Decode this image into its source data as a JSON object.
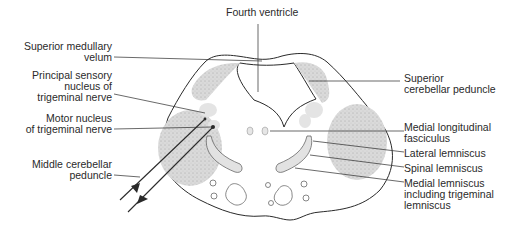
{
  "diagram": {
    "colors": {
      "ink": "#2a2a2a",
      "stipple_fill": "#d9d9d9",
      "light_fill": "#e6e6e6",
      "background": "#ffffff"
    },
    "labels": {
      "fourth_ventricle": "Fourth ventricle",
      "superior_medullary_velum": "Superior medullary\nvelum",
      "principal_sensory_nucleus": "Principal sensory\nnucleus of\ntrigeminal nerve",
      "motor_nucleus": "Motor nucleus\nof trigeminal nerve",
      "middle_cerebellar_peduncle": "Middle cerebellar\npeduncle",
      "superior_cerebellar_peduncle": "Superior\ncerebellar peduncle",
      "medial_longitudinal_fasciculus": "Medial longitudinal\nfasciculus",
      "lateral_lemniscus": "Lateral lemniscus",
      "spinal_lemniscus": "Spinal lemniscus",
      "medial_lemniscus": "Medial lemniscus\nincluding trigeminal\nlemniscus"
    }
  }
}
